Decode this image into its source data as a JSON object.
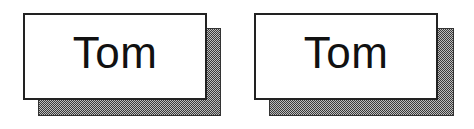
{
  "cards": [
    {
      "label": "Tom"
    },
    {
      "label": "Tom"
    }
  ],
  "colors": {
    "background": "#ffffff",
    "border": "#222222",
    "shadow_dark": "#3a3a3a",
    "shadow_light": "#bdbdbd",
    "text": "#111111"
  }
}
